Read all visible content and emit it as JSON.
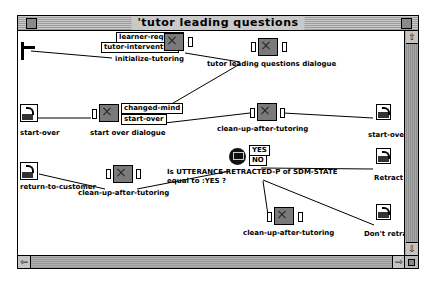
{
  "window": {
    "title": "'tutor leading questions"
  },
  "nodes": {
    "initialize": {
      "label": "initialize-tutoring",
      "ports": [
        "learner-request",
        "tutor-intervention"
      ]
    },
    "tutor_dialogue": {
      "label": "tutor leading questions dialogue"
    },
    "start_over_in": {
      "label": "start-over"
    },
    "start_over_dialogue": {
      "label": "start over dialogue",
      "ports": [
        "changed-mind",
        "start-over"
      ]
    },
    "cleanup1": {
      "label": "clean-up-after-tutoring"
    },
    "start_over_out": {
      "label": "start-over"
    },
    "return_customer": {
      "label": "return-to-customer"
    },
    "cleanup2": {
      "label": "clean-up-after-tutoring"
    },
    "condition": {
      "text_line1": "Is UTTERANCE-RETRACTED-P of SDM-STATE",
      "text_line2": "equal to :YES ?",
      "yes": "YES",
      "no": "NO"
    },
    "retract": {
      "label": "Retract"
    },
    "dont_retract": {
      "label": "Don't retract"
    },
    "cleanup3": {
      "label": "clean-up-after-tutoring"
    }
  },
  "scroll": {
    "up": "⇧",
    "down": "⇩",
    "left": "⇦",
    "right": "⇨"
  }
}
